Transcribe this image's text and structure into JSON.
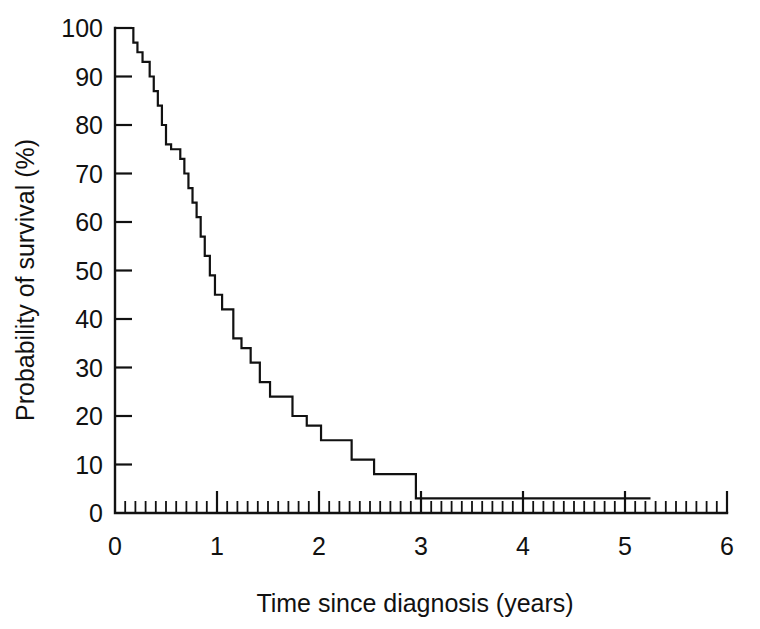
{
  "chart_data": {
    "type": "line",
    "subtype": "kaplan-meier-step",
    "title": "",
    "xlabel": "Time since diagnosis (years)",
    "ylabel": "Probability of survival (%)",
    "xlim": [
      0,
      6
    ],
    "ylim": [
      0,
      100
    ],
    "grid": false,
    "legend": "none",
    "x_ticks_major": [
      0,
      1,
      2,
      3,
      4,
      5,
      6
    ],
    "x_tick_labels": [
      "0",
      "1",
      "2",
      "3",
      "4",
      "5",
      "6"
    ],
    "x_minor_tick_interval": 0.1,
    "y_ticks_major": [
      0,
      10,
      20,
      30,
      40,
      50,
      60,
      70,
      80,
      90,
      100
    ],
    "y_tick_labels": [
      "0",
      "10",
      "20",
      "30",
      "40",
      "50",
      "60",
      "70",
      "80",
      "90",
      "100"
    ],
    "line_color": "#111111",
    "series": [
      {
        "name": "Survival",
        "x": [
          0.0,
          0.12,
          0.18,
          0.22,
          0.27,
          0.31,
          0.34,
          0.38,
          0.42,
          0.46,
          0.5,
          0.55,
          0.6,
          0.64,
          0.68,
          0.72,
          0.76,
          0.8,
          0.84,
          0.88,
          0.93,
          0.98,
          1.05,
          1.1,
          1.16,
          1.24,
          1.33,
          1.42,
          1.52,
          1.62,
          1.74,
          1.88,
          2.02,
          2.16,
          2.32,
          2.54,
          2.95,
          5.25
        ],
        "y": [
          100,
          100,
          97,
          95,
          93,
          93,
          90,
          87,
          84,
          80,
          76,
          75,
          75,
          73,
          70,
          67,
          64,
          61,
          57,
          53,
          49,
          45,
          42,
          42,
          36,
          34,
          31,
          27,
          24,
          24,
          20,
          18,
          15,
          15,
          11,
          8,
          3,
          3
        ]
      }
    ],
    "tail_censor_x": 5.25,
    "tail_value": 3
  }
}
